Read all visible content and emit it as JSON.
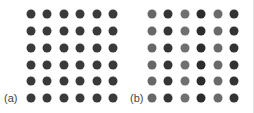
{
  "panels": [
    {
      "label": "(a)",
      "label_x": 4,
      "cols_x": [
        31,
        47,
        64,
        80,
        97,
        113
      ],
      "rows_y": [
        14,
        31,
        48,
        65,
        81,
        98
      ],
      "column_colors": [
        "#3a3a3a",
        "#3a3a3a",
        "#3a3a3a",
        "#3a3a3a",
        "#3a3a3a",
        "#3a3a3a"
      ]
    },
    {
      "label": "(b)",
      "label_x": 130,
      "cols_x": [
        152,
        168,
        185,
        201,
        218,
        234
      ],
      "rows_y": [
        14,
        31,
        48,
        65,
        81,
        98
      ],
      "column_colors": [
        "#676767",
        "#353535",
        "#707070",
        "#2c2c2c",
        "#6a6a6a",
        "#333333"
      ]
    }
  ],
  "border_color": "#e4e4e4"
}
